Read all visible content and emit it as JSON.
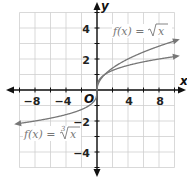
{
  "chart_data": {
    "type": "line",
    "title": "",
    "xlabel": "x",
    "ylabel": "y",
    "xlim": [
      -10,
      10
    ],
    "ylim": [
      -5,
      5
    ],
    "grid": true,
    "x_grid_step": 2,
    "y_grid_step": 1,
    "x_ticks": [
      -8,
      -4,
      4,
      8
    ],
    "y_ticks": [
      4,
      2,
      -2,
      -4
    ],
    "origin_label": "O",
    "series": [
      {
        "name": "f(x) = √x",
        "function": "sqrt",
        "domain": [
          0,
          10
        ],
        "x": [
          0,
          1,
          2,
          4,
          6,
          8,
          10
        ],
        "values": [
          0,
          1,
          1.41,
          2,
          2.45,
          2.83,
          3.16
        ],
        "color": "#777777"
      },
      {
        "name": "f(x) = ∛x",
        "function": "cbrt",
        "domain": [
          -10,
          10
        ],
        "x": [
          -10,
          -8,
          -6,
          -4,
          -2,
          -1,
          0,
          1,
          2,
          4,
          6,
          8,
          10
        ],
        "values": [
          -2.15,
          -2,
          -1.82,
          -1.59,
          -1.26,
          -1,
          0,
          1,
          1.26,
          1.59,
          1.82,
          2,
          2.15
        ],
        "color": "#777777"
      }
    ],
    "annotations": [
      {
        "text_prefix": "f(x) = ",
        "radical": "√",
        "radicand": "x",
        "index": "",
        "near": "upper right"
      },
      {
        "text_prefix": "f(x) = ",
        "radical": "√",
        "radicand": "x",
        "index": "3",
        "near": "lower left"
      }
    ]
  },
  "labels": {
    "x_axis": "x",
    "y_axis": "y",
    "origin": "O",
    "eq_sqrt_prefix": "f(x) = ",
    "eq_sqrt_radicand": "x",
    "eq_cbrt_prefix": "f(x) = ",
    "eq_cbrt_index": "3",
    "eq_cbrt_radicand": "x",
    "xtick_m8": "−8",
    "xtick_m4": "−4",
    "xtick_4": "4",
    "xtick_8": "8",
    "ytick_4": "4",
    "ytick_2": "2",
    "ytick_m2": "−2",
    "ytick_m4": "−4"
  },
  "colors": {
    "grid": "#cfcfcf",
    "axis": "#111111",
    "curve": "#777777",
    "label": "#777777"
  }
}
